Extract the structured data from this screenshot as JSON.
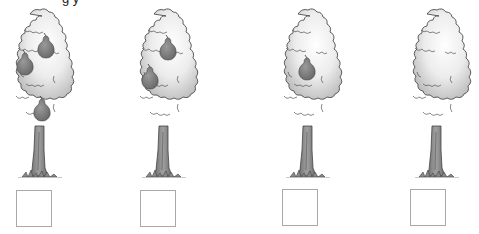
{
  "worksheet": {
    "header_cutoff": "g y",
    "colors": {
      "background": "#ffffff",
      "crown_fill_light": "#f7f7f7",
      "crown_fill_dark": "#c9c9c9",
      "crown_outline": "#555555",
      "trunk_fill": "#8a8a8a",
      "pear_fill": "#7d7d7d",
      "box_border": "#a9a9a9"
    },
    "trees": [
      {
        "index": 1,
        "pear_count": 3,
        "answer": ""
      },
      {
        "index": 2,
        "pear_count": 2,
        "answer": ""
      },
      {
        "index": 3,
        "pear_count": 1,
        "answer": ""
      },
      {
        "index": 4,
        "pear_count": 0,
        "answer": ""
      }
    ]
  }
}
